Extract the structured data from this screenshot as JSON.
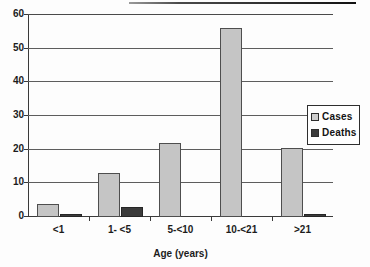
{
  "chart_data": {
    "type": "bar",
    "title": "",
    "xlabel": "Age (years)",
    "ylabel": "",
    "categories": [
      "<1",
      "1- <5",
      "5-<10",
      "10-<21",
      ">21"
    ],
    "series": [
      {
        "name": "Cases",
        "color": "#c5c5c5",
        "values": [
          4,
          13,
          22,
          56,
          20.5
        ]
      },
      {
        "name": "Deaths",
        "color": "#3b3b3b",
        "values": [
          1,
          3,
          0,
          0,
          1
        ]
      }
    ],
    "ylim": [
      0,
      60
    ],
    "ytick_values": [
      0,
      10,
      20,
      30,
      40,
      50,
      60
    ],
    "ytick_labels": [
      "0",
      "10",
      "20",
      "30",
      "40",
      "50",
      "60"
    ],
    "grid": true,
    "legend_position": "right"
  },
  "legend": {
    "items": [
      {
        "label": "Cases",
        "swatch": "cases-swatch-icon"
      },
      {
        "label": "Deaths",
        "swatch": "deaths-swatch-icon"
      }
    ]
  }
}
